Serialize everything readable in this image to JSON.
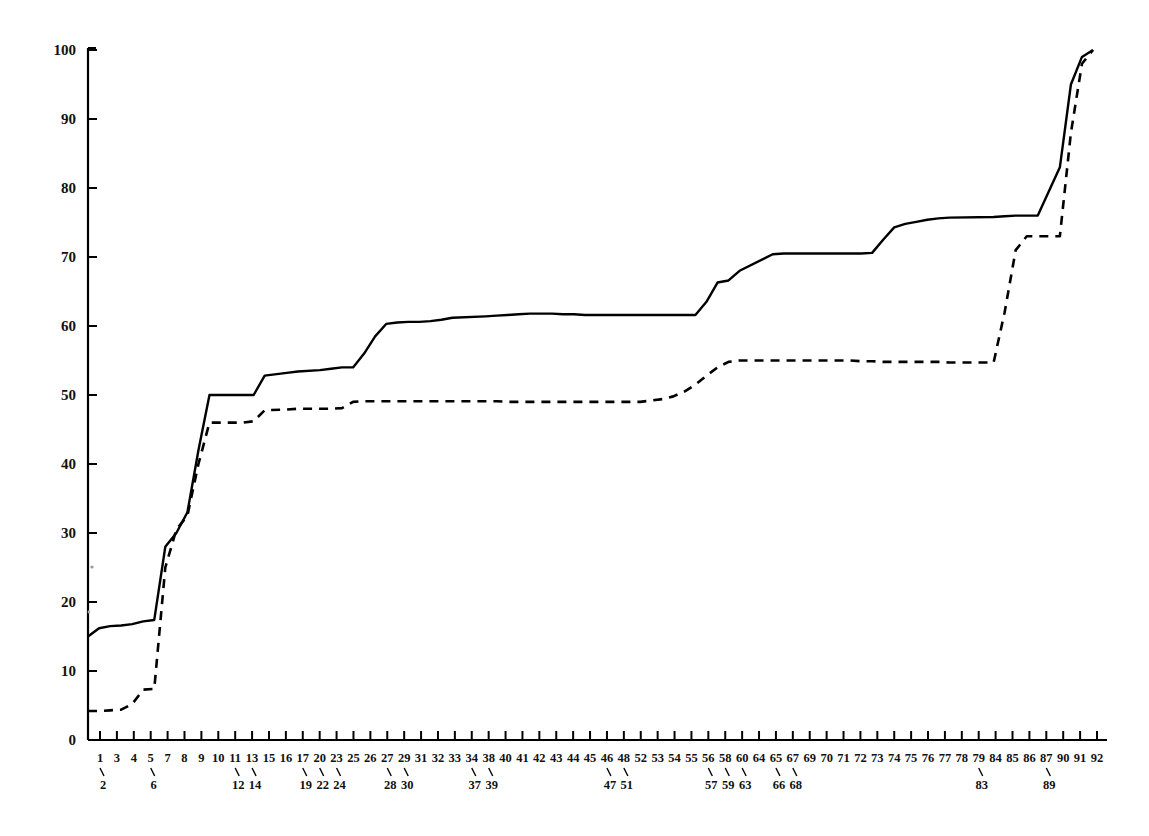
{
  "chart_data": {
    "type": "line",
    "title": "",
    "subtitle": "",
    "xlabel": "",
    "ylabel": "",
    "grid": false,
    "legend_position": "none",
    "xlim": [
      0,
      93
    ],
    "ylim": [
      0,
      100
    ],
    "y_ticks": [
      0,
      10,
      20,
      30,
      40,
      50,
      60,
      70,
      80,
      90,
      100
    ],
    "x_tick_labels": [
      "1",
      "2",
      "3",
      "4",
      "5",
      "6",
      "7",
      "8",
      "9",
      "10",
      "11",
      "12",
      "13",
      "14",
      "15",
      "16",
      "17",
      "19",
      "20",
      "22",
      "23",
      "24",
      "25",
      "26",
      "27",
      "28",
      "29",
      "30",
      "31",
      "32",
      "33",
      "34",
      "37",
      "38",
      "39",
      "40",
      "41",
      "42",
      "43",
      "44",
      "45",
      "46",
      "47",
      "48",
      "51",
      "52",
      "53",
      "54",
      "55",
      "56",
      "57",
      "58",
      "59",
      "60",
      "63",
      "64",
      "65",
      "66",
      "67",
      "68",
      "69",
      "70",
      "71",
      "72",
      "73",
      "74",
      "75",
      "76",
      "77",
      "78",
      "79",
      "83",
      "84",
      "85",
      "86",
      "87",
      "89",
      "90",
      "91",
      "92"
    ],
    "x_labels_row1": [
      "1",
      "3",
      "4",
      "5",
      "7",
      "8",
      "9",
      "10",
      "11",
      "13",
      "15",
      "16",
      "17",
      "20",
      "23",
      "25",
      "26",
      "27",
      "29",
      "31",
      "32",
      "33",
      "34",
      "38",
      "40",
      "41",
      "42",
      "43",
      "44",
      "45",
      "46",
      "48",
      "52",
      "53",
      "54",
      "55",
      "56",
      "58",
      "60",
      "64",
      "65",
      "67",
      "69",
      "70",
      "71",
      "72",
      "73",
      "74",
      "75",
      "76",
      "77",
      "78",
      "79",
      "84",
      "85",
      "86",
      "87",
      "90",
      "91",
      "92"
    ],
    "x_labels_row2": [
      "2",
      "6",
      "12",
      "14",
      "19",
      "22",
      "24",
      "28",
      "30",
      "37",
      "39",
      "47",
      "51",
      "57",
      "59",
      "63",
      "66",
      "68",
      "83",
      "89"
    ],
    "x_ticks_count": 60,
    "series": [
      {
        "name": "solid-curve",
        "style": "solid",
        "color": "#000000",
        "points": [
          [
            1,
            15.0
          ],
          [
            2,
            16.2
          ],
          [
            3,
            16.5
          ],
          [
            4,
            16.6
          ],
          [
            5,
            16.8
          ],
          [
            6,
            17.2
          ],
          [
            7,
            17.4
          ],
          [
            8,
            28.0
          ],
          [
            9,
            30.0
          ],
          [
            10,
            33.0
          ],
          [
            11,
            42.0
          ],
          [
            12,
            50.0
          ],
          [
            13,
            50.0
          ],
          [
            14,
            50.0
          ],
          [
            15,
            50.0
          ],
          [
            16,
            50.0
          ],
          [
            17,
            52.8
          ],
          [
            19,
            53.2
          ],
          [
            20,
            53.4
          ],
          [
            22,
            53.6
          ],
          [
            23,
            53.8
          ],
          [
            24,
            54.0
          ],
          [
            25,
            54.0
          ],
          [
            26,
            56.0
          ],
          [
            27,
            58.5
          ],
          [
            28,
            60.3
          ],
          [
            29,
            60.5
          ],
          [
            30,
            60.6
          ],
          [
            31,
            60.6
          ],
          [
            32,
            60.7
          ],
          [
            33,
            60.9
          ],
          [
            34,
            61.2
          ],
          [
            37,
            61.4
          ],
          [
            38,
            61.5
          ],
          [
            39,
            61.6
          ],
          [
            40,
            61.7
          ],
          [
            41,
            61.8
          ],
          [
            42,
            61.8
          ],
          [
            43,
            61.8
          ],
          [
            44,
            61.7
          ],
          [
            45,
            61.7
          ],
          [
            46,
            61.6
          ],
          [
            47,
            61.6
          ],
          [
            48,
            61.6
          ],
          [
            51,
            61.6
          ],
          [
            52,
            61.6
          ],
          [
            53,
            61.6
          ],
          [
            54,
            61.6
          ],
          [
            55,
            61.6
          ],
          [
            56,
            61.6
          ],
          [
            57,
            63.5
          ],
          [
            58,
            66.3
          ],
          [
            59,
            66.6
          ],
          [
            60,
            68.0
          ],
          [
            63,
            70.4
          ],
          [
            64,
            70.5
          ],
          [
            65,
            70.5
          ],
          [
            66,
            70.5
          ],
          [
            67,
            70.5
          ],
          [
            68,
            70.5
          ],
          [
            69,
            70.5
          ],
          [
            70,
            70.5
          ],
          [
            71,
            70.5
          ],
          [
            72,
            70.6
          ],
          [
            73,
            72.5
          ],
          [
            74,
            74.3
          ],
          [
            75,
            74.8
          ],
          [
            76,
            75.1
          ],
          [
            77,
            75.4
          ],
          [
            78,
            75.6
          ],
          [
            79,
            75.7
          ],
          [
            83,
            75.8
          ],
          [
            84,
            75.9
          ],
          [
            85,
            76.0
          ],
          [
            86,
            76.0
          ],
          [
            87,
            76.0
          ],
          [
            89,
            83.0
          ],
          [
            90,
            95.0
          ],
          [
            91,
            99.0
          ],
          [
            92,
            100.0
          ]
        ]
      },
      {
        "name": "dashed-curve",
        "style": "dashed",
        "color": "#000000",
        "points": [
          [
            1,
            4.2
          ],
          [
            2,
            4.2
          ],
          [
            3,
            4.3
          ],
          [
            4,
            4.4
          ],
          [
            5,
            5.2
          ],
          [
            6,
            7.3
          ],
          [
            7,
            7.4
          ],
          [
            8,
            25.0
          ],
          [
            9,
            30.5
          ],
          [
            10,
            32.5
          ],
          [
            11,
            40.0
          ],
          [
            12,
            46.0
          ],
          [
            13,
            46.0
          ],
          [
            14,
            46.0
          ],
          [
            15,
            46.0
          ],
          [
            16,
            46.2
          ],
          [
            17,
            47.8
          ],
          [
            19,
            47.9
          ],
          [
            20,
            48.0
          ],
          [
            22,
            48.0
          ],
          [
            23,
            48.0
          ],
          [
            24,
            48.1
          ],
          [
            25,
            49.0
          ],
          [
            26,
            49.1
          ],
          [
            27,
            49.1
          ],
          [
            28,
            49.1
          ],
          [
            29,
            49.1
          ],
          [
            30,
            49.1
          ],
          [
            31,
            49.1
          ],
          [
            32,
            49.1
          ],
          [
            33,
            49.1
          ],
          [
            34,
            49.1
          ],
          [
            37,
            49.1
          ],
          [
            38,
            49.1
          ],
          [
            39,
            49.0
          ],
          [
            40,
            49.0
          ],
          [
            41,
            49.0
          ],
          [
            42,
            49.0
          ],
          [
            43,
            49.0
          ],
          [
            44,
            49.0
          ],
          [
            45,
            49.0
          ],
          [
            46,
            49.0
          ],
          [
            47,
            49.0
          ],
          [
            48,
            49.0
          ],
          [
            51,
            49.0
          ],
          [
            52,
            49.2
          ],
          [
            53,
            49.4
          ],
          [
            54,
            49.8
          ],
          [
            55,
            50.5
          ],
          [
            56,
            51.5
          ],
          [
            57,
            52.8
          ],
          [
            58,
            54.0
          ],
          [
            59,
            54.8
          ],
          [
            60,
            55.0
          ],
          [
            63,
            55.0
          ],
          [
            64,
            55.0
          ],
          [
            65,
            55.0
          ],
          [
            66,
            55.0
          ],
          [
            67,
            55.0
          ],
          [
            68,
            55.0
          ],
          [
            69,
            55.0
          ],
          [
            70,
            55.0
          ],
          [
            71,
            54.9
          ],
          [
            72,
            54.9
          ],
          [
            73,
            54.8
          ],
          [
            74,
            54.8
          ],
          [
            75,
            54.8
          ],
          [
            76,
            54.8
          ],
          [
            77,
            54.8
          ],
          [
            78,
            54.8
          ],
          [
            79,
            54.7
          ],
          [
            83,
            54.7
          ],
          [
            84,
            62.0
          ],
          [
            85,
            71.0
          ],
          [
            86,
            73.0
          ],
          [
            87,
            73.0
          ],
          [
            89,
            73.0
          ],
          [
            90,
            88.0
          ],
          [
            91,
            98.0
          ],
          [
            92,
            100.0
          ]
        ]
      }
    ]
  }
}
